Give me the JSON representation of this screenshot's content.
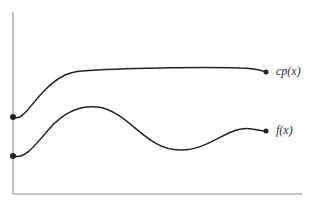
{
  "diagram": {
    "type": "function-curves",
    "axes": {
      "x_axis": true,
      "y_axis": true,
      "tick_labels": false
    },
    "curves": [
      {
        "name": "envelope",
        "label": "cp(x)",
        "color": "#222222"
      },
      {
        "name": "target",
        "label": "f(x)",
        "color": "#222222"
      }
    ]
  }
}
